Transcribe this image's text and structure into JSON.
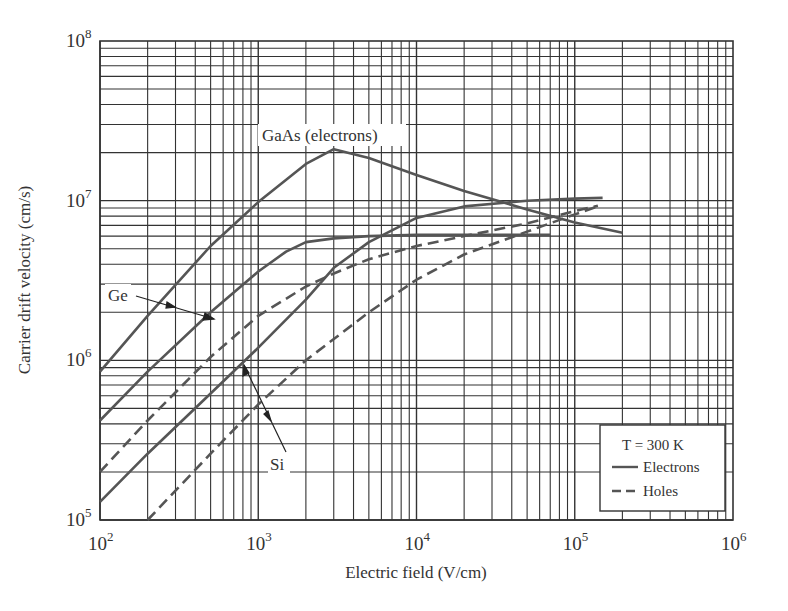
{
  "chart_data": {
    "type": "line",
    "title": "",
    "xlabel": "Electric field (V/cm)",
    "ylabel": "Carrier drift velocity (cm/s)",
    "xscale": "log",
    "yscale": "log",
    "xlim": [
      100,
      1000000
    ],
    "ylim": [
      100000,
      100000000
    ],
    "grid": true,
    "x_ticks": [
      {
        "base": "10",
        "exp": "2"
      },
      {
        "base": "10",
        "exp": "3"
      },
      {
        "base": "10",
        "exp": "4"
      },
      {
        "base": "10",
        "exp": "5"
      },
      {
        "base": "10",
        "exp": "6"
      }
    ],
    "y_ticks": [
      {
        "base": "10",
        "exp": "5"
      },
      {
        "base": "10",
        "exp": "6"
      },
      {
        "base": "10",
        "exp": "7"
      },
      {
        "base": "10",
        "exp": "8"
      }
    ],
    "legend": {
      "position": "lower right",
      "title": "T = 300 K",
      "entries": [
        {
          "label": "Electrons",
          "style": "solid"
        },
        {
          "label": "Holes",
          "style": "dashed"
        }
      ]
    },
    "series": [
      {
        "name": "GaAs (electrons)",
        "style": "solid",
        "x": [
          100,
          200,
          500,
          1000,
          2000,
          3000,
          5000,
          10000,
          20000,
          50000,
          100000,
          200000
        ],
        "y": [
          850000,
          1900000,
          5200000,
          9800000,
          17000000,
          21000000,
          18500000,
          14500000,
          11500000,
          8800000,
          7300000,
          6300000
        ]
      },
      {
        "name": "Ge electrons",
        "style": "solid",
        "x": [
          100,
          200,
          500,
          1000,
          1500,
          2000,
          3000,
          5000,
          10000,
          30000,
          70000
        ],
        "y": [
          420000,
          850000,
          2000000,
          3600000,
          4800000,
          5500000,
          5800000,
          6000000,
          6100000,
          6100000,
          6100000
        ]
      },
      {
        "name": "Si electrons",
        "style": "solid",
        "x": [
          100,
          200,
          500,
          1000,
          2000,
          3000,
          5000,
          10000,
          20000,
          50000,
          100000,
          150000
        ],
        "y": [
          130000,
          260000,
          620000,
          1200000,
          2400000,
          3800000,
          5500000,
          7800000,
          9200000,
          10000000,
          10300000,
          10400000
        ]
      },
      {
        "name": "Ge holes",
        "style": "dashed",
        "x": [
          100,
          200,
          500,
          1000,
          2000,
          3000,
          5000,
          10000,
          20000,
          50000,
          100000,
          140000
        ],
        "y": [
          200000,
          420000,
          1050000,
          1900000,
          2900000,
          3500000,
          4300000,
          5200000,
          6000000,
          7200000,
          8600000,
          9300000
        ]
      },
      {
        "name": "Si holes",
        "style": "dashed",
        "x": [
          200,
          500,
          1000,
          2000,
          5000,
          10000,
          20000,
          50000,
          100000,
          140000
        ],
        "y": [
          100000,
          260000,
          530000,
          1000000,
          2000000,
          3200000,
          4600000,
          6400000,
          8200000,
          9200000
        ]
      }
    ],
    "annotations": [
      {
        "text": "GaAs (electrons)",
        "x": 3000,
        "y": 24000000
      },
      {
        "text": "Ge",
        "arrow_targets": [
          [
            240,
            1450000
          ],
          [
            500,
            1050000
          ]
        ]
      },
      {
        "text": "Si",
        "arrow_targets": [
          [
            750,
            1000000
          ],
          [
            1300,
            540000
          ]
        ]
      }
    ]
  },
  "labels": {
    "ge": "Ge",
    "si": "Si",
    "gaas": "GaAs (electrons)"
  }
}
